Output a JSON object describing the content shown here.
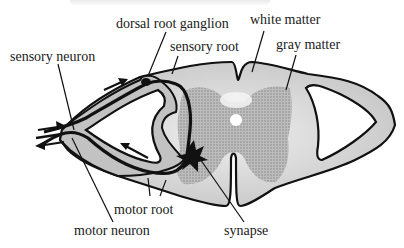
{
  "diagram": {
    "labels": {
      "dorsal_root_ganglion": "dorsal root ganglion",
      "white_matter": "white matter",
      "sensory_root": "sensory root",
      "gray_matter": "gray matter",
      "sensory_neuron": "sensory neuron",
      "motor_root": "motor root",
      "motor_neuron": "motor neuron",
      "synapse": "synapse"
    },
    "colors": {
      "white_matter": "#c8c8c8",
      "gray_matter": "#a9a9a9",
      "outline": "#111111",
      "background": "#ffffff"
    }
  }
}
